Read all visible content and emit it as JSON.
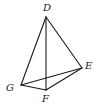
{
  "diagram": {
    "type": "tetrahedron",
    "vertices": [
      {
        "id": "D",
        "label": "D",
        "x": 46,
        "y": 17,
        "lx": 43,
        "ly": 11
      },
      {
        "id": "E",
        "label": "E",
        "x": 82,
        "y": 68,
        "lx": 85,
        "ly": 69
      },
      {
        "id": "G",
        "label": "G",
        "x": 21,
        "y": 85,
        "lx": 6,
        "ly": 91
      },
      {
        "id": "F",
        "label": "F",
        "x": 46,
        "y": 90,
        "lx": 42,
        "ly": 102
      }
    ],
    "edges": [
      [
        "D",
        "G"
      ],
      [
        "D",
        "F"
      ],
      [
        "D",
        "E"
      ],
      [
        "G",
        "F"
      ],
      [
        "F",
        "E"
      ],
      [
        "G",
        "E"
      ]
    ],
    "labels": {
      "D": "D",
      "E": "E",
      "G": "G",
      "F": "F"
    }
  }
}
